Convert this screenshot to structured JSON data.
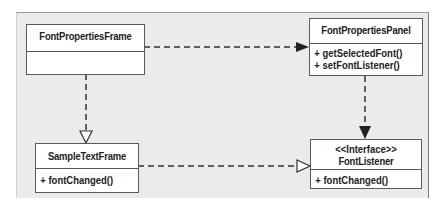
{
  "diagram": {
    "type": "UML class diagram",
    "classes": [
      {
        "id": "fpf",
        "name": "FontPropertiesFrame",
        "stereotype": null,
        "operations": []
      },
      {
        "id": "fpp",
        "name": "FontPropertiesPanel",
        "stereotype": null,
        "operations": [
          "+ getSelectedFont()",
          "+ setFontListener()"
        ]
      },
      {
        "id": "stf",
        "name": "SampleTextFrame",
        "stereotype": null,
        "operations": [
          "+ fontChanged()"
        ]
      },
      {
        "id": "fl",
        "name": "FontListener",
        "stereotype": "<<Interface>>",
        "operations": [
          "+ fontChanged()"
        ]
      }
    ],
    "relationships": [
      {
        "from": "FontPropertiesFrame",
        "to": "FontPropertiesPanel",
        "kind": "dependency",
        "line": "dashed",
        "arrowhead": "filled"
      },
      {
        "from": "FontPropertiesFrame",
        "to": "SampleTextFrame",
        "kind": "realization",
        "line": "dashed",
        "arrowhead": "hollow-triangle"
      },
      {
        "from": "FontPropertiesPanel",
        "to": "FontListener",
        "kind": "dependency",
        "line": "dashed",
        "arrowhead": "filled"
      },
      {
        "from": "SampleTextFrame",
        "to": "FontListener",
        "kind": "realization",
        "line": "dashed",
        "arrowhead": "hollow-triangle"
      }
    ],
    "colors": {
      "background": "#ebebeb",
      "box": "#ffffff",
      "line": "#333333"
    }
  }
}
